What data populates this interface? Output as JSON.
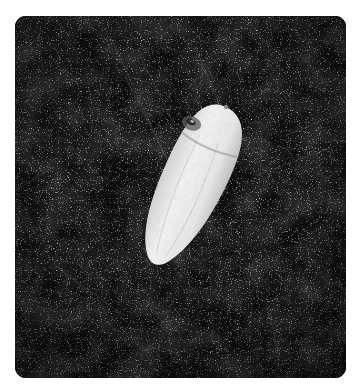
{
  "image": {
    "subject": "single white grain seed on dark speckled surface",
    "alt": "Close-up photograph of a pale, elongated seed grain lying diagonally on a dark, speckled background",
    "colors": {
      "background": "#0c0c0c",
      "speckle": "#9a9a9a",
      "seed": "#e8e8e8",
      "seed_shadow": "#bdbdbd",
      "embryo_spot": "#3a3a3a",
      "page": "#ffffff"
    },
    "frame": {
      "x": 15,
      "y": 16,
      "width": 331,
      "height": 362,
      "corner_radius": 11
    }
  }
}
